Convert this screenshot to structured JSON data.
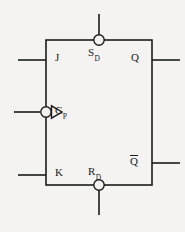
{
  "diagram": {
    "type": "logic-symbol",
    "background_color": "#f4f3f1",
    "line_color": "#1b1b1b",
    "body": {
      "shape": "rectangle",
      "x": 46,
      "y": 40,
      "width": 106,
      "height": 145
    },
    "labels": {
      "j": "J",
      "k": "K",
      "clock_main": "C",
      "clock_sub": "P",
      "set_main": "S",
      "set_sub": "D",
      "reset_main": "R",
      "reset_sub": "D",
      "q": "Q",
      "q_bar": "Q"
    },
    "pins": [
      {
        "name": "J",
        "label": "J",
        "side": "left",
        "inverted": false,
        "clock": false
      },
      {
        "name": "Cp",
        "label": "C_P",
        "side": "left",
        "inverted": true,
        "clock": true
      },
      {
        "name": "K",
        "label": "K",
        "side": "left",
        "inverted": false,
        "clock": false
      },
      {
        "name": "Sd",
        "label": "S_D",
        "side": "top",
        "inverted": true,
        "clock": false
      },
      {
        "name": "Rd",
        "label": "R_D",
        "side": "bottom",
        "inverted": true,
        "clock": false
      },
      {
        "name": "Q",
        "label": "Q",
        "side": "right",
        "inverted": false,
        "clock": false
      },
      {
        "name": "Qbar",
        "label": "Q-bar",
        "side": "right",
        "inverted": false,
        "clock": false
      }
    ]
  }
}
